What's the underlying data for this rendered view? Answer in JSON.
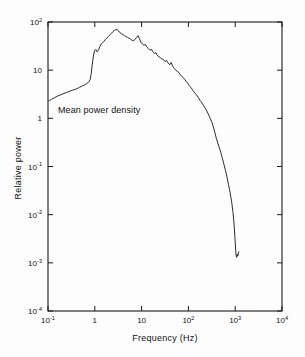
{
  "figure": {
    "background_color": "#fdfdfd",
    "line_color": "#141414",
    "axis_color": "#1a1a1a"
  },
  "annotations": {
    "mean_power_density": "Mean power density"
  },
  "axes": {
    "x_title": "Frequency   (Hz)",
    "y_title": "Relative power"
  },
  "chart_data": {
    "type": "line",
    "title": "",
    "subtitle": "",
    "xlabel": "Frequency   (Hz)",
    "ylabel": "Relative power",
    "xscale": "log",
    "yscale": "log",
    "xlim": [
      0.1,
      10000
    ],
    "ylim": [
      0.0001,
      100
    ],
    "grid": false,
    "legend": null,
    "xticks": [
      0.1,
      1,
      10,
      100,
      1000,
      10000
    ],
    "xtick_labels": [
      "10⁻¹",
      "1",
      "10",
      "10²",
      "10³",
      "10⁴"
    ],
    "yticks": [
      0.0001,
      0.001,
      0.01,
      0.1,
      1,
      10,
      100
    ],
    "ytick_labels": [
      "10⁻⁴",
      "10⁻³",
      "10⁻²",
      "10⁻¹",
      "1",
      "10",
      "10²"
    ],
    "annotations": [
      {
        "text": "Mean power density",
        "x": 0.13,
        "y": 1.7
      }
    ],
    "series": [
      {
        "name": "Mean power density",
        "x": [
          0.105,
          0.12,
          0.14,
          0.16,
          0.19,
          0.22,
          0.26,
          0.3,
          0.35,
          0.41,
          0.47,
          0.54,
          0.62,
          0.7,
          0.76,
          0.8,
          0.84,
          0.88,
          0.93,
          0.98,
          1.05,
          1.12,
          1.2,
          1.28,
          1.37,
          1.47,
          1.58,
          1.7,
          1.82,
          1.95,
          2.1,
          2.25,
          2.4,
          2.6,
          2.8,
          3.0,
          3.2,
          3.45,
          3.7,
          4.0,
          4.3,
          4.6,
          5.0,
          5.4,
          5.8,
          6.2,
          6.7,
          7.2,
          7.8,
          8.4,
          9.0,
          9.7,
          10.4,
          11.2,
          12.1,
          13.0,
          14.0,
          15.1,
          16.3,
          17.5,
          18.9,
          20.3,
          21.9,
          23.6,
          25.4,
          27.4,
          29.5,
          31.8,
          34.2,
          36.9,
          39.7,
          42.8,
          46.1,
          49.6,
          53.5,
          57.6,
          62.0,
          66.8,
          72.0,
          77.5,
          83.5,
          90.0,
          97.0,
          104.0,
          112.0,
          121.0,
          130.0,
          140.0,
          151.0,
          163.0,
          175.0,
          189.0,
          203.0,
          219.0,
          236.0,
          254.0,
          274.0,
          295.0,
          318.0,
          342.0,
          369.0,
          397.0,
          428.0,
          461.0,
          497.0,
          535.0,
          576.0,
          621.0,
          669.0,
          720.0,
          776.0,
          836.0,
          900.0,
          950.0,
          990.0,
          1020.0,
          1050.0,
          1080.0,
          1110.0,
          1140.0,
          1170.0,
          1200.0
        ],
        "y": [
          2.3,
          2.5,
          2.7,
          2.9,
          3.1,
          3.3,
          3.5,
          3.7,
          3.9,
          4.1,
          4.4,
          4.7,
          5.0,
          5.4,
          5.9,
          6.5,
          8.5,
          13.0,
          19.0,
          25.0,
          27.0,
          24.0,
          26.0,
          31.0,
          35.0,
          37.0,
          40.0,
          44.0,
          47.0,
          50.0,
          54.0,
          58.0,
          62.0,
          66.0,
          69.0,
          70.0,
          66.0,
          60.0,
          57.0,
          55.0,
          52.0,
          50.0,
          48.0,
          46.0,
          44.0,
          42.0,
          41.0,
          43.0,
          48.0,
          52.0,
          45.0,
          38.0,
          35.0,
          33.0,
          34.0,
          30.0,
          28.0,
          26.0,
          27.0,
          24.0,
          22.0,
          23.0,
          20.0,
          19.0,
          18.0,
          17.0,
          16.5,
          15.0,
          16.0,
          14.0,
          13.0,
          14.5,
          12.0,
          11.0,
          10.0,
          9.5,
          9.0,
          8.0,
          7.5,
          7.0,
          6.4,
          5.8,
          5.3,
          4.8,
          4.4,
          4.0,
          3.6,
          3.3,
          3.0,
          2.7,
          2.4,
          2.2,
          1.95,
          1.75,
          1.55,
          1.35,
          1.15,
          0.98,
          0.82,
          0.66,
          0.5,
          0.38,
          0.3,
          0.24,
          0.19,
          0.145,
          0.11,
          0.082,
          0.06,
          0.042,
          0.029,
          0.019,
          0.011,
          0.006,
          0.0032,
          0.0019,
          0.0014,
          0.0013,
          0.0015,
          0.0014,
          0.0016,
          0.0017
        ]
      }
    ]
  }
}
